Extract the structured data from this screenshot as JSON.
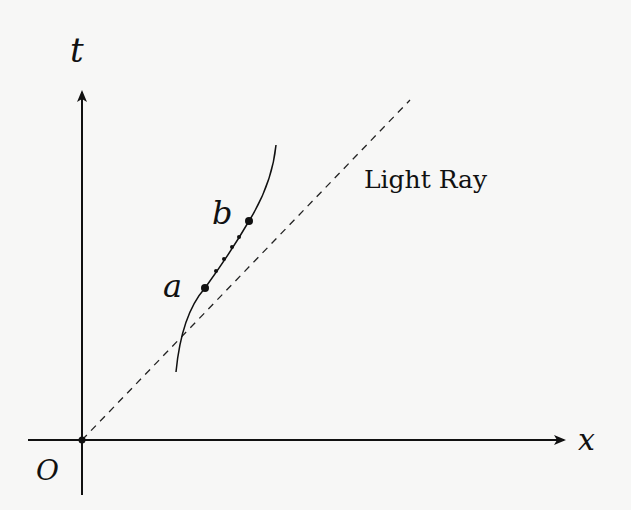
{
  "diagram": {
    "type": "spacetime-diagram",
    "axes": {
      "vertical_label": "t",
      "horizontal_label": "x",
      "origin_label": "O"
    },
    "light_ray": {
      "label": "Light Ray",
      "style": "dashed"
    },
    "worldline": {
      "points": [
        {
          "label": "a"
        },
        {
          "label": "b"
        }
      ],
      "intermediate_dots": 4
    },
    "colors": {
      "ink": "#111111",
      "background": "#f7f7f6"
    }
  }
}
